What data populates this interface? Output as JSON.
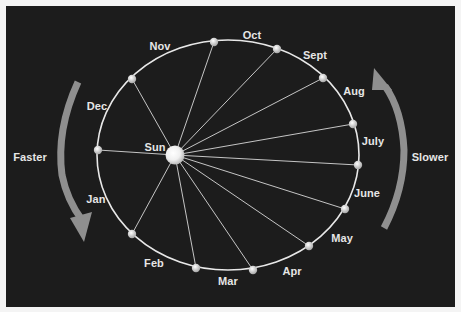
{
  "diagram": {
    "title": "",
    "center_label": "Sun",
    "left_arrow_label": "Faster",
    "right_arrow_label": "Slower",
    "colors": {
      "background": "#1c1c1c",
      "frame": "#f4f4f4",
      "orbit": "#e8e8e8",
      "arrow": "#8f8f8f",
      "text": "#e6e6e6"
    },
    "months": [
      {
        "label": "Jan",
        "x": 98,
        "y": 150,
        "lx": 96,
        "ly": 199
      },
      {
        "label": "Feb",
        "x": 132,
        "y": 234,
        "lx": 154,
        "ly": 263
      },
      {
        "label": "Mar",
        "x": 196,
        "y": 268,
        "lx": 228,
        "ly": 281
      },
      {
        "label": "Apr",
        "x": 253,
        "y": 270,
        "lx": 292,
        "ly": 271
      },
      {
        "label": "May",
        "x": 309,
        "y": 246,
        "lx": 342,
        "ly": 238
      },
      {
        "label": "June",
        "x": 345,
        "y": 209,
        "lx": 367,
        "ly": 193
      },
      {
        "label": "July",
        "x": 358,
        "y": 165,
        "lx": 373,
        "ly": 141
      },
      {
        "label": "Aug",
        "x": 353,
        "y": 124,
        "lx": 354,
        "ly": 91
      },
      {
        "label": "Sept",
        "x": 323,
        "y": 78,
        "lx": 315,
        "ly": 55
      },
      {
        "label": "Oct",
        "x": 277,
        "y": 49,
        "lx": 252,
        "ly": 35
      },
      {
        "label": "Nov",
        "x": 214,
        "y": 42,
        "lx": 160,
        "ly": 46
      },
      {
        "label": "Dec",
        "x": 132,
        "y": 79,
        "lx": 97,
        "ly": 106
      }
    ],
    "sun": {
      "x": 175,
      "y": 155,
      "lx": 155,
      "ly": 147
    }
  }
}
